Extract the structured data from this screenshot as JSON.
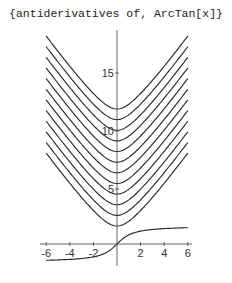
{
  "chart_data": {
    "type": "line",
    "title": "{antiderivatives of, ArcTan[x]}",
    "xlabel": "",
    "ylabel": "",
    "xlim": [
      -6,
      6
    ],
    "ylim": [
      -1.5,
      19
    ],
    "grid": false,
    "legend": null,
    "x_ticks": [
      -6,
      -4,
      -2,
      2,
      4,
      6
    ],
    "x_tick_labels": [
      "-6",
      "-4",
      "-2",
      "2",
      "4",
      "6"
    ],
    "y_ticks": [
      5,
      10,
      15
    ],
    "y_tick_labels": [
      "5",
      "10",
      "15"
    ],
    "series": [
      {
        "name": "ArcTan[x]",
        "formula": "ArcTan[x]",
        "x": [
          -6,
          -4,
          -2,
          -1,
          0,
          1,
          2,
          4,
          6
        ],
        "values": [
          -1.41,
          -1.33,
          -1.11,
          -0.79,
          0,
          0.79,
          1.11,
          1.33,
          1.41
        ]
      },
      {
        "name": "antiderivative C1",
        "formula": "x ArcTan[x] - Log[1+x^2]/2 + C",
        "min_value": 1.8
      },
      {
        "name": "antiderivative C2",
        "min_value": 2.7
      },
      {
        "name": "antiderivative C3",
        "min_value": 3.6
      },
      {
        "name": "antiderivative C4",
        "min_value": 4.5
      },
      {
        "name": "antiderivative C5",
        "min_value": 5.4
      },
      {
        "name": "antiderivative C6",
        "min_value": 6.4
      },
      {
        "name": "antiderivative C7",
        "min_value": 7.3
      },
      {
        "name": "antiderivative C8",
        "min_value": 8.2
      },
      {
        "name": "antiderivative C9",
        "min_value": 9.1
      },
      {
        "name": "antiderivative C10",
        "min_value": 10.0
      },
      {
        "name": "antiderivative C11",
        "min_value": 11.0
      },
      {
        "name": "antiderivative C12",
        "min_value": 11.9
      }
    ],
    "render": {
      "origin_px": [
        117,
        244
      ],
      "x_scale_px": 11.8,
      "y_scale_px": 11.6,
      "curve_min_px": [
        226,
        215.4,
        204.7,
        194.1,
        183.5,
        172.8,
        162.2,
        151.5,
        140.9,
        130.3,
        119.6,
        109
      ],
      "curve_vscale_px": 11.0
    }
  }
}
